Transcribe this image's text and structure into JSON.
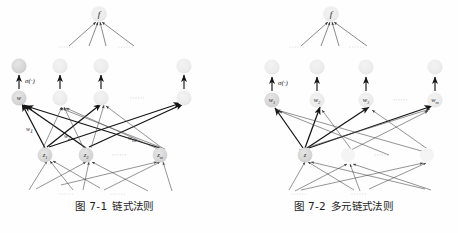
{
  "page": {
    "background_color": "#fefefe",
    "width": 458,
    "height": 233
  },
  "colors": {
    "node_fill_strong": "#d4d4d4",
    "node_fill_faded": "#e9e9e9",
    "node_fill_ghost": "#f1f1f1",
    "edge_strong": "#151515",
    "edge_light": "#4a4a4a",
    "text": "#1a1a1a",
    "dots": "#9a9a9a"
  },
  "figures": [
    {
      "id": "chain-rule",
      "caption_number": "图 7-1",
      "caption_title": "链式法则",
      "output_node": {
        "label": "f"
      },
      "activation_label": "σ(·)",
      "hidden_row": {
        "nodes": [
          {
            "label": "w",
            "sub": "",
            "emphasis": "strong"
          },
          {
            "label": "",
            "sub": "",
            "emphasis": "faded"
          },
          {
            "label": "",
            "sub": "",
            "emphasis": "faded"
          },
          {
            "label": "",
            "sub": "",
            "emphasis": "faded"
          }
        ],
        "ellipsis": "······"
      },
      "input_row": {
        "nodes": [
          {
            "label": "z",
            "sub": "1"
          },
          {
            "label": "z",
            "sub": "2"
          },
          {
            "label": "z",
            "sub": "m"
          }
        ],
        "ellipsis": "······"
      },
      "weights": [
        {
          "label": "w",
          "sub": "1"
        },
        {
          "label": "w",
          "sub": "2"
        },
        {
          "label": "w",
          "sub": "m"
        }
      ],
      "ellipses": [
        "······",
        "······",
        "······",
        "······",
        "······"
      ]
    },
    {
      "id": "multivariate-chain-rule",
      "caption_number": "图 7-2",
      "caption_title": "多元链式法则",
      "output_node": {
        "label": "f"
      },
      "activation_label": "σ(·)",
      "hidden_row": {
        "nodes": [
          {
            "label": "w",
            "sub": "1"
          },
          {
            "label": "w",
            "sub": "2"
          },
          {
            "label": "w",
            "sub": "3"
          },
          {
            "label": "w",
            "sub": "m"
          }
        ],
        "ellipsis": "······"
      },
      "input_row": {
        "nodes": [
          {
            "label": "z",
            "sub": ""
          }
        ],
        "ellipsis": "······"
      },
      "ellipses": [
        "······",
        "······",
        "······",
        "······"
      ]
    }
  ]
}
